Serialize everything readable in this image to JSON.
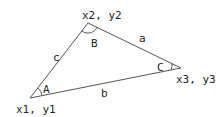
{
  "diagram": {
    "type": "triangle",
    "stroke_color": "#555555",
    "vertices": {
      "p1": {
        "label": "x1, y1",
        "x": 30,
        "y": 98
      },
      "p2": {
        "label": "x2, y2",
        "x": 88,
        "y": 23
      },
      "p3": {
        "label": "x3, y3",
        "x": 181,
        "y": 68
      }
    },
    "sides": {
      "a": {
        "label": "a"
      },
      "b": {
        "label": "b"
      },
      "c": {
        "label": "c"
      }
    },
    "angles": {
      "A": {
        "label": "A"
      },
      "B": {
        "label": "B"
      },
      "C": {
        "label": "C"
      }
    }
  }
}
